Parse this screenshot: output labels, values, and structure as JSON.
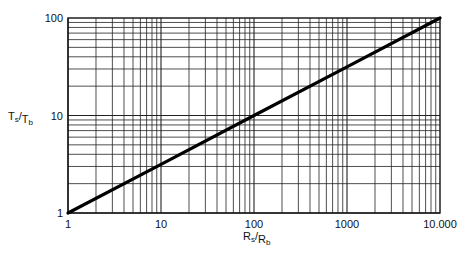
{
  "chart_data": {
    "type": "line",
    "title": "",
    "xlabel": "Rs/Rb",
    "xlabel_main": "R",
    "xlabel_sub_num": "s",
    "xlabel_sub_den": "b",
    "ylabel": "Ts/Tb",
    "ylabel_main": "T",
    "ylabel_sub_num": "s",
    "ylabel_sub_den": "b",
    "xscale": "log",
    "yscale": "log",
    "xlim": [
      1,
      10000
    ],
    "ylim": [
      1,
      100
    ],
    "grid": true,
    "x_ticks": [
      {
        "value": 1,
        "label": "1"
      },
      {
        "value": 10,
        "label": "10"
      },
      {
        "value": 100,
        "label": "100"
      },
      {
        "value": 1000,
        "label": "1000"
      },
      {
        "value": 10000,
        "label": "10.000"
      }
    ],
    "y_ticks": [
      {
        "value": 1,
        "label": "1"
      },
      {
        "value": 10,
        "label": "10"
      },
      {
        "value": 100,
        "label": "100"
      }
    ],
    "series": [
      {
        "name": "Ts/Tb = sqrt(Rs/Rb)",
        "x": [
          1,
          10,
          100,
          1000,
          10000
        ],
        "y": [
          1,
          3.16,
          10,
          31.6,
          100
        ]
      }
    ],
    "legend": "none"
  }
}
